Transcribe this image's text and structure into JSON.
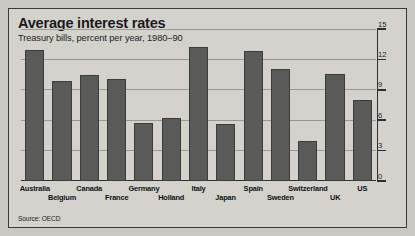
{
  "header": {
    "title": "Average interest rates",
    "subtitle": "Treasury bills, percent per year, 1980–90"
  },
  "source": "Source: OECD",
  "chart_data": {
    "type": "bar",
    "title": "Average interest rates",
    "subtitle": "Treasury bills, percent per year, 1980–90",
    "xlabel": "",
    "ylabel": "",
    "ylim": [
      0,
      15
    ],
    "yticks": [
      0,
      3,
      6,
      9,
      12,
      15
    ],
    "ytick_labels": [
      "0",
      "3",
      "6",
      "9",
      "12",
      "15"
    ],
    "grid": true,
    "axis_position": "right",
    "legend": "none",
    "source": "Source: OECD",
    "categories": [
      "Australia",
      "Belgium",
      "Canada",
      "France",
      "Germany",
      "Holland",
      "Italy",
      "Japan",
      "Spain",
      "Sweden",
      "Switzerland",
      "UK",
      "US"
    ],
    "values": [
      12.9,
      9.9,
      10.5,
      10.1,
      5.7,
      6.2,
      13.2,
      5.6,
      12.8,
      11.1,
      3.9,
      10.6,
      8.0
    ],
    "label_rows": [
      0,
      1,
      0,
      1,
      0,
      1,
      0,
      1,
      0,
      1,
      0,
      1,
      0
    ],
    "bar_color": "#5a5a58",
    "background_color": "#d4d2cd"
  }
}
